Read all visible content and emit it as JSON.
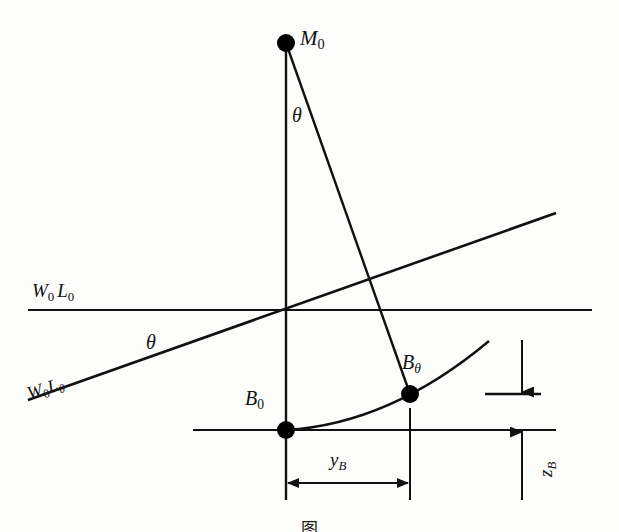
{
  "figure": {
    "title_caption": "图",
    "background_color": "#fdfdfc",
    "line_color": "#111111",
    "point_color": "#000000"
  },
  "labels": {
    "metacentre": {
      "base": "M",
      "sub": "0",
      "text": "M0"
    },
    "centre_buoyancy_upright": {
      "base": "B",
      "sub": "0",
      "text": "B0"
    },
    "centre_buoyancy_heeled": {
      "base": "B",
      "sub": "θ",
      "text": "Bθ"
    },
    "waterline_upright": {
      "base1": "W",
      "sub1": "0",
      "base2": "L",
      "sub2": "0",
      "text": "W0L0"
    },
    "waterline_heeled": {
      "base1": "W",
      "sub1": "0",
      "base2": "L",
      "sub2": "θ",
      "text": "W0Lθ"
    },
    "angle_top": "θ",
    "angle_waterline": "θ",
    "horizontal_shift": {
      "base": "y",
      "sub": "B",
      "text": "yB"
    },
    "vertical_shift": {
      "base": "z",
      "sub": "B",
      "text": "zB"
    }
  },
  "geometry": {
    "points": {
      "M0": {
        "x": 286,
        "y": 43,
        "r": 9
      },
      "B0": {
        "x": 286,
        "y": 430,
        "r": 9
      },
      "Btheta": {
        "x": 410,
        "y": 394,
        "r": 9
      }
    },
    "centerline": {
      "x": 286,
      "y_top": 48,
      "y_bottom": 500
    },
    "waterline_upright": {
      "x1": 28,
      "y1": 310,
      "x2": 592,
      "y2": 310
    },
    "waterline_heeled": {
      "x1": 28,
      "y1": 400,
      "x2": 556,
      "y2": 213
    },
    "baseline": {
      "x1": 193,
      "y1": 430,
      "x2": 556,
      "y2": 430
    },
    "buoyancy_curve": {
      "start_x": 286,
      "start_y": 430,
      "ctrl_x": 390,
      "ctrl_y": 424,
      "end_x": 489,
      "end_y": 341
    },
    "righting_arm_line": {
      "x1": 286,
      "y1": 43,
      "x2": 410,
      "y2": 394
    },
    "short_hline_right": {
      "x1": 485,
      "y1": 394,
      "x2": 541,
      "y2": 394
    },
    "ext_line_btheta": {
      "x": 410,
      "y_top": 408,
      "y_bottom": 500
    },
    "ext_line_b0": {
      "x": 286,
      "y_top": 430,
      "y_bottom": 500
    },
    "yb_dimension": {
      "x1": 286,
      "x2": 410,
      "y": 483
    },
    "zb_dimension": {
      "x": 522,
      "y_top": 340,
      "y_bottom": 500,
      "arrow_top_y": 394,
      "arrow_bottom_y": 430
    }
  },
  "label_positions": {
    "M0": {
      "left": 300,
      "top": 28
    },
    "B0": {
      "left": 245,
      "top": 388
    },
    "Btheta": {
      "left": 402,
      "top": 352
    },
    "W0L0": {
      "left": 32,
      "top": 281
    },
    "W0Ltheta": {
      "left": 31,
      "top": 384
    },
    "theta_top": {
      "left": 292,
      "top": 105
    },
    "theta_waterline": {
      "left": 146,
      "top": 332
    },
    "yB": {
      "left": 330,
      "top": 450
    },
    "zB": {
      "left": 540,
      "top": 458
    },
    "caption": {
      "top": 508,
      "font_size": 17
    }
  }
}
